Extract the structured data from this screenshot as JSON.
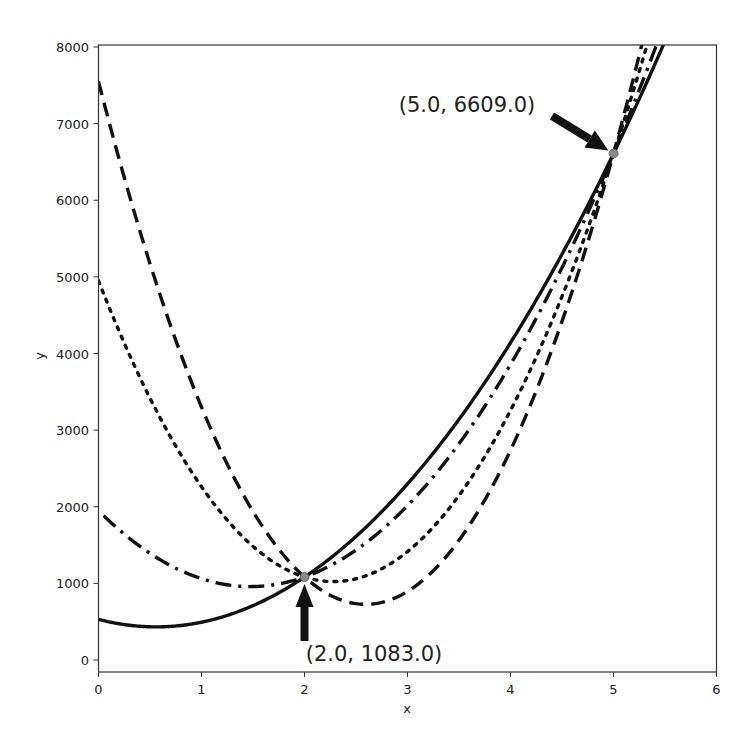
{
  "chart_data": {
    "type": "line",
    "title": "",
    "xlabel": "x",
    "ylabel": "y",
    "xlim": [
      0,
      6
    ],
    "ylim": [
      -150,
      8000
    ],
    "grid": false,
    "legend": null,
    "x_ticks": [
      0,
      1,
      2,
      3,
      4,
      5,
      6
    ],
    "y_ticks": [
      0,
      1000,
      2000,
      3000,
      4000,
      5000,
      6000,
      7000,
      8000
    ],
    "series": [
      {
        "name": "solid",
        "style": "solid",
        "color": "#111111",
        "formula": "313.1*x^2 - 349.9*x + 530",
        "coef": [
          313.1,
          -349.9,
          530
        ],
        "x": [
          0,
          0.5,
          1,
          1.5,
          2,
          2.5,
          3,
          3.5,
          4,
          4.5,
          5,
          5.5
        ],
        "y": [
          530,
          433,
          493,
          708,
          1083,
          1612,
          2299,
          3141,
          4139,
          5293,
          6609,
          8071
        ]
      },
      {
        "name": "dash-dot",
        "style": "dashdot",
        "color": "#111111",
        "formula": "455.1*x^2 - 1343.7*x + 1950",
        "coef": [
          455.1,
          -1343.7,
          1950
        ],
        "x": [
          0.05,
          0.5,
          1,
          1.5,
          2,
          2.5,
          3,
          3.5,
          4,
          4.5,
          5,
          5.5
        ],
        "y": [
          1884,
          1392,
          1061,
          959,
          1083,
          1437,
          2015,
          2828,
          3868,
          5134,
          6609,
          8311
        ]
      },
      {
        "name": "dotted",
        "style": "dotted",
        "color": "#111111",
        "formula": "755.1*x^2 - 3443.7*x + 4950",
        "coef": [
          755.1,
          -3443.7,
          4950
        ],
        "x": [
          0,
          0.5,
          1,
          1.5,
          2,
          2.5,
          3,
          3.5,
          4,
          4.5,
          5,
          5.5
        ],
        "y": [
          4950,
          3417,
          2261,
          1483,
          1083,
          1061,
          1418,
          2152,
          3265,
          4755,
          6609,
          8850
        ]
      },
      {
        "name": "dashed",
        "style": "dashed",
        "color": "#111111",
        "formula": "1015.1*x^2 - 5263.7*x + 7550",
        "coef": [
          1015.1,
          -5263.7,
          7550
        ],
        "x": [
          0,
          0.5,
          1,
          1.5,
          2,
          2.5,
          3,
          3.5,
          4,
          4.5,
          5,
          5.5
        ],
        "y": [
          7550,
          5172,
          3301,
          1939,
          1083,
          735,
          894,
          1561,
          2735,
          4417,
          6609,
          9300
        ]
      }
    ],
    "annotations": [
      {
        "text": "(2.0, 1083.0)",
        "point": [
          2.0,
          1083.0
        ],
        "text_pos": [
          2.0,
          130
        ],
        "arrow": "up"
      },
      {
        "text": "(5.0, 6609.0)",
        "point": [
          5.0,
          6609.0
        ],
        "text_pos": [
          3.0,
          7300
        ],
        "arrow": "down-right"
      }
    ],
    "markers": [
      {
        "x": 2.0,
        "y": 1083.0,
        "color": "#888888"
      },
      {
        "x": 5.0,
        "y": 6609.0,
        "color": "#888888"
      }
    ]
  }
}
